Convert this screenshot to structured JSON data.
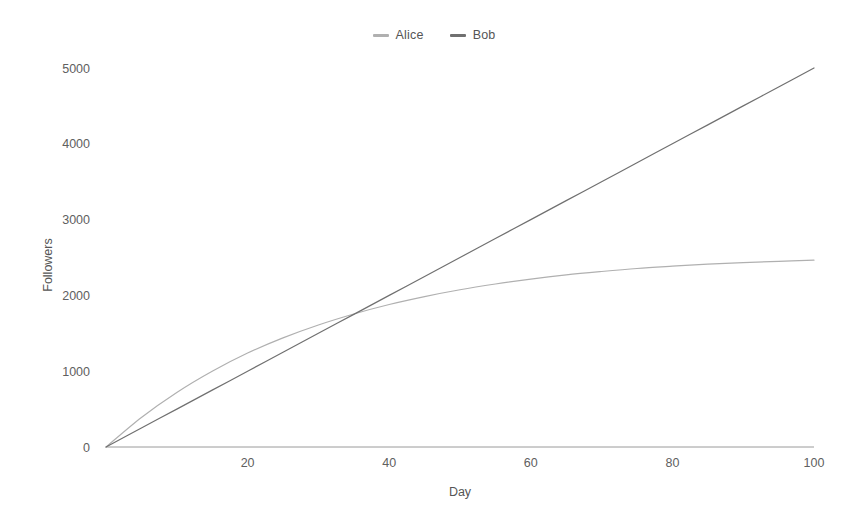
{
  "chart_data": {
    "type": "line",
    "title": "",
    "xlabel": "Day",
    "ylabel": "Followers",
    "xlim": [
      0,
      100
    ],
    "ylim": [
      0,
      5200
    ],
    "xticks": [
      20,
      40,
      60,
      80,
      100
    ],
    "yticks": [
      0,
      1000,
      2000,
      3000,
      4000,
      5000
    ],
    "grid": false,
    "legend_position": "top-center",
    "x": [
      0,
      5,
      10,
      15,
      20,
      25,
      30,
      35,
      40,
      45,
      50,
      55,
      60,
      65,
      70,
      75,
      80,
      85,
      90,
      95,
      100
    ],
    "series": [
      {
        "name": "Alice",
        "color": "#b0b0b0",
        "values": [
          0,
          390,
          720,
          1000,
          1240,
          1440,
          1610,
          1755,
          1880,
          1985,
          2075,
          2150,
          2215,
          2270,
          2315,
          2355,
          2385,
          2412,
          2432,
          2450,
          2465
        ]
      },
      {
        "name": "Bob",
        "color": "#707070",
        "values": [
          0,
          250,
          500,
          750,
          1000,
          1250,
          1500,
          1750,
          2000,
          2250,
          2500,
          2750,
          3000,
          3250,
          3500,
          3750,
          4000,
          4250,
          4500,
          4750,
          5000
        ]
      }
    ]
  },
  "legend": {
    "entries": [
      {
        "label": "Alice",
        "marker": "line-marker"
      },
      {
        "label": "Bob",
        "marker": "line-marker"
      }
    ]
  },
  "axes": {
    "x": {
      "title": "Day",
      "ticks": [
        "20",
        "40",
        "60",
        "80",
        "100"
      ]
    },
    "y": {
      "title": "Followers",
      "ticks": [
        "0",
        "1000",
        "2000",
        "3000",
        "4000",
        "5000"
      ]
    }
  },
  "colors": {
    "alice": "#b0b0b0",
    "bob": "#707070",
    "axis": "#9a9a9a",
    "text": "#5a5a5a",
    "background": "#ffffff"
  }
}
